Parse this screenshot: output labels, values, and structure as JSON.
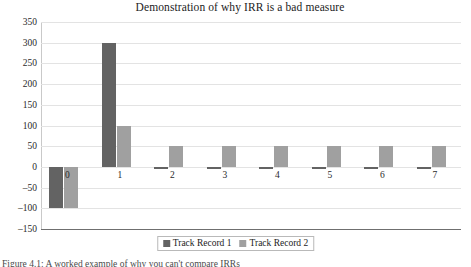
{
  "figure": {
    "caption": "Figure 4.1: A worked example of why you can't compare IRRs"
  },
  "legend": {
    "position": "bottom",
    "entries": [
      {
        "label": "Track Record 1",
        "color": "#636363"
      },
      {
        "label": "Track Record 2",
        "color": "#a0a0a0"
      }
    ]
  },
  "chart_data": {
    "type": "bar",
    "title": "Demonstration of why IRR is a bad measure",
    "xlabel": "",
    "ylabel": "",
    "categories": [
      "0",
      "1",
      "2",
      "3",
      "4",
      "5",
      "6",
      "7"
    ],
    "series": [
      {
        "name": "Track Record 1",
        "color": "#636363",
        "values": [
          -100,
          300,
          -5,
          -5,
          -5,
          -5,
          -5,
          -5
        ]
      },
      {
        "name": "Track Record 2",
        "color": "#a0a0a0",
        "values": [
          -100,
          100,
          50,
          50,
          50,
          50,
          50,
          50
        ]
      }
    ],
    "ylim": [
      -150,
      350
    ],
    "ytick_step": 50,
    "yticks": [
      "350",
      "300",
      "250",
      "200",
      "150",
      "100",
      "50",
      "0",
      "-50",
      "-100",
      "-150"
    ],
    "grid": true,
    "legend_position": "bottom"
  }
}
